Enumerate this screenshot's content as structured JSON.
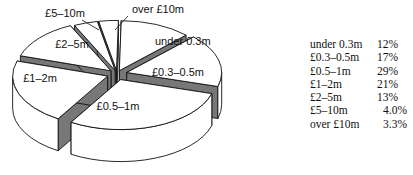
{
  "chart_data": {
    "type": "pie",
    "style": "3d-exploded",
    "title": "",
    "categories": [
      "under 0.3m",
      "£0.3–0.5m",
      "£0.5–1m",
      "£1–2m",
      "£2–5m",
      "£5–10m",
      "over £10m"
    ],
    "values": [
      12,
      17,
      29,
      21,
      13,
      4.0,
      3.3
    ],
    "value_labels": [
      "12%",
      "17%",
      "29%",
      "21%",
      "13%",
      "4.0%",
      "3.3%"
    ],
    "slice_labels": [
      "under 0.3m",
      "£0.3–0.5m",
      "£0.5–1m",
      "£1–2m",
      "£2–5m",
      "£5–10m",
      "over £10m"
    ],
    "legend_position": "right"
  },
  "legend": [
    {
      "name": "under 0.3m",
      "value": "12%"
    },
    {
      "name": "£0.3–0.5m",
      "value": "17%"
    },
    {
      "name": "£0.5–1m",
      "value": "29%"
    },
    {
      "name": "£1–2m",
      "value": "21%"
    },
    {
      "name": "£2–5m",
      "value": "13%"
    },
    {
      "name": "£5–10m",
      "value": "4.0%"
    },
    {
      "name": "over £10m",
      "value": "3.3%"
    }
  ]
}
